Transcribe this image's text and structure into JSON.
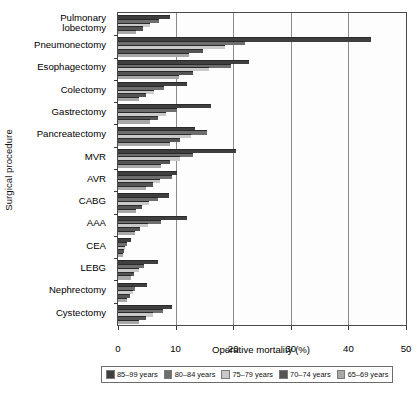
{
  "chart_data": {
    "type": "bar",
    "orientation": "horizontal",
    "title": "",
    "xlabel": "Operative mortality (%)",
    "ylabel": "Surgical procedure",
    "xlim": [
      0,
      50
    ],
    "xticks": [
      0,
      10,
      20,
      30,
      40,
      50
    ],
    "grid": true,
    "legend_position": "bottom",
    "categories": [
      "Pulmonary\nlobectomy",
      "Pneumonectomy",
      "Esophagectomy",
      "Colectomy",
      "Gastrectomy",
      "Pancreatectomy",
      "MVR",
      "AVR",
      "CABG",
      "AAA",
      "CEA",
      "LEBG",
      "Nephrectomy",
      "Cystectomy"
    ],
    "series": [
      {
        "name": "85–99 years",
        "color": "#3f3f3f",
        "values": [
          9.0,
          44.0,
          22.7,
          11.9,
          16.2,
          13.3,
          20.5,
          10.3,
          8.9,
          11.9,
          2.2,
          7.0,
          5.1,
          9.3
        ]
      },
      {
        "name": "80–84 years",
        "color": "#6e6e6e",
        "values": [
          7.2,
          22.1,
          19.6,
          8.0,
          10.2,
          15.4,
          13.0,
          9.3,
          7.0,
          7.4,
          1.6,
          4.6,
          3.0,
          7.8
        ]
      },
      {
        "name": "75–79 years",
        "color": "#c9c9c9",
        "values": [
          5.5,
          18.6,
          15.8,
          6.3,
          8.4,
          12.6,
          10.8,
          7.3,
          5.3,
          5.2,
          1.3,
          3.6,
          2.6,
          6.1
        ]
      },
      {
        "name": "70–74 years",
        "color": "#555555",
        "values": [
          4.3,
          14.8,
          13.0,
          4.8,
          7.0,
          10.8,
          9.0,
          6.0,
          4.1,
          3.9,
          1.1,
          2.8,
          2.0,
          4.9
        ]
      },
      {
        "name": "65–69 years",
        "color": "#a8a8a8",
        "values": [
          3.1,
          12.3,
          10.6,
          3.7,
          5.5,
          9.0,
          7.5,
          4.9,
          3.2,
          2.9,
          0.9,
          2.2,
          1.6,
          3.6
        ]
      }
    ]
  },
  "axis": {
    "xticklabels": [
      "0",
      "10",
      "20",
      "30",
      "40",
      "50"
    ]
  }
}
